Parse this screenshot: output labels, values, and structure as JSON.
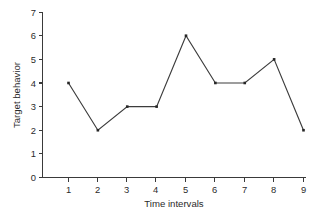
{
  "chart_data": {
    "type": "line",
    "title": "",
    "xlabel": "Time intervals",
    "ylabel": "Target behavior",
    "x": [
      1,
      2,
      3,
      4,
      5,
      6,
      7,
      8,
      9
    ],
    "values": [
      4,
      2,
      3,
      3,
      6,
      4,
      4,
      5,
      2
    ],
    "series": [
      {
        "name": "Target behavior",
        "values": [
          4,
          2,
          3,
          3,
          6,
          4,
          4,
          5,
          2
        ]
      }
    ],
    "xtick_labels": [
      "1",
      "2",
      "3",
      "4",
      "5",
      "6",
      "7",
      "8",
      "9"
    ],
    "ytick_labels": [
      "0",
      "1",
      "2",
      "3",
      "4",
      "5",
      "6",
      "7"
    ],
    "ytick_values": [
      0,
      1,
      2,
      3,
      4,
      5,
      6,
      7
    ],
    "xlim": [
      0.6,
      9.4
    ],
    "ylim": [
      0,
      7
    ],
    "grid": false,
    "legend": false,
    "legend_position": "none",
    "marker": "square",
    "line_color": "#3c3c3c",
    "marker_color": "#262626",
    "axis_color": "#3a3a3a",
    "background_color": "#ffffff"
  }
}
